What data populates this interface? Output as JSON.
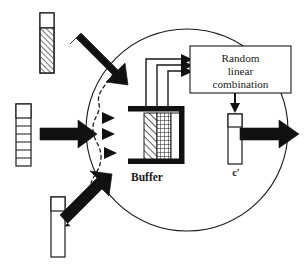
{
  "figure": {
    "type": "diagram",
    "background_color": "#ffffff",
    "stroke_color": "#1a1a1a",
    "fill_black": "#111111"
  },
  "node": {
    "name": "coding-node-circle",
    "shape": "circle",
    "center_x": 187,
    "center_y": 130,
    "radius": 101
  },
  "blocks": {
    "random_linear_combination": {
      "name": "random-linear-combination-box",
      "line1": "Random",
      "line2": "linear",
      "line3": "combination"
    },
    "buffer": {
      "name": "buffer-block",
      "label": "Buffer",
      "columns": [
        {
          "id": "col-hatched",
          "fill": "diagonal-hatch"
        },
        {
          "id": "col-grid",
          "fill": "cross-grid"
        },
        {
          "id": "col-plain",
          "fill": "white"
        }
      ]
    },
    "output_vector": {
      "name": "output-vector-c-prime",
      "label": "c′",
      "cells": [
        {
          "id": "cell-head",
          "fill": "white"
        },
        {
          "id": "cell-body",
          "fill": "white"
        }
      ]
    }
  },
  "input_vectors": [
    {
      "name": "input-vector-top",
      "position": "top-left",
      "cells": [
        {
          "id": "top-head",
          "fill": "white"
        },
        {
          "id": "top-body",
          "fill": "diagonal-hatch"
        }
      ]
    },
    {
      "name": "input-vector-middle",
      "position": "middle-left",
      "cells": [
        {
          "id": "mid-head",
          "fill": "white"
        },
        {
          "id": "mid-1",
          "fill": "white"
        },
        {
          "id": "mid-2",
          "fill": "white"
        },
        {
          "id": "mid-3",
          "fill": "white"
        },
        {
          "id": "mid-4",
          "fill": "white"
        },
        {
          "id": "mid-5",
          "fill": "white"
        },
        {
          "id": "mid-6",
          "fill": "white"
        }
      ]
    },
    {
      "name": "input-vector-bottom",
      "position": "bottom-left",
      "cells": [
        {
          "id": "bot-head",
          "fill": "white"
        },
        {
          "id": "bot-body",
          "fill": "white"
        }
      ]
    }
  ],
  "arrows": {
    "thick_inputs": [
      {
        "name": "input-arrow-top",
        "direction": "down-right"
      },
      {
        "name": "input-arrow-middle",
        "direction": "right"
      },
      {
        "name": "input-arrow-bottom",
        "direction": "up-right"
      }
    ],
    "output": {
      "name": "output-arrow",
      "direction": "right"
    },
    "buffer_feeds": [
      {
        "name": "buffer-feed-arrow-1"
      },
      {
        "name": "buffer-feed-arrow-2"
      },
      {
        "name": "buffer-feed-arrow-3"
      }
    ],
    "combination_to_output": {
      "name": "combination-to-output-arrow",
      "direction": "down"
    },
    "small_dashed_arrows": [
      {
        "name": "dashed-arrow-top"
      },
      {
        "name": "dashed-arrow-middle"
      },
      {
        "name": "dashed-arrow-bottom"
      }
    ]
  },
  "dashed_curve": {
    "name": "dashed-intake-curve",
    "style": "dashed",
    "shape": "s-curve"
  }
}
